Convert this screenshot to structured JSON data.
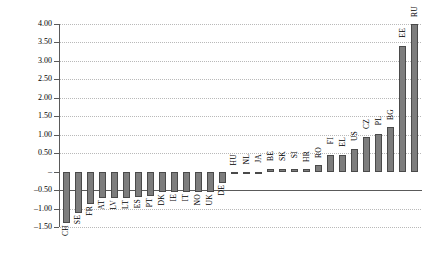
{
  "chart_data": {
    "type": "bar",
    "title": "",
    "xlabel": "",
    "ylabel": "Deviation from mean",
    "ylim": [
      -1.5,
      4.0
    ],
    "ytick_labels": [
      "4.00",
      "3.50",
      "3.00",
      "2.50",
      "2.00",
      "1.50",
      "1.00",
      "0.50",
      "–",
      "–0.50",
      "–1.00",
      "–1.50"
    ],
    "ytick_values": [
      4.0,
      3.5,
      3.0,
      2.5,
      2.0,
      1.5,
      1.0,
      0.5,
      0.0,
      -0.5,
      -1.0,
      -1.5
    ],
    "grid": true,
    "legend": "none",
    "bar_color": "#7d7d7d",
    "bar_edge_color": "#4a4a4a",
    "categories": [
      "CH",
      "SE",
      "FR",
      "AT",
      "LV",
      "LT",
      "ES",
      "PT",
      "DK",
      "IE",
      "IT",
      "NO",
      "UK",
      "DE",
      "HU",
      "NL",
      "JA",
      "BE",
      "SK",
      "SI",
      "HR",
      "RO",
      "FI",
      "EL",
      "US",
      "CZ",
      "PL",
      "BG",
      "EE",
      "RU"
    ],
    "values": [
      -1.38,
      -1.13,
      -0.88,
      -0.72,
      -0.72,
      -0.72,
      -0.7,
      -0.66,
      -0.56,
      -0.55,
      -0.55,
      -0.55,
      -0.54,
      -0.3,
      0.0,
      0.0,
      0.0,
      0.07,
      0.07,
      0.06,
      0.06,
      0.18,
      0.46,
      0.46,
      0.62,
      0.93,
      1.02,
      1.2,
      3.4,
      4.0
    ]
  }
}
